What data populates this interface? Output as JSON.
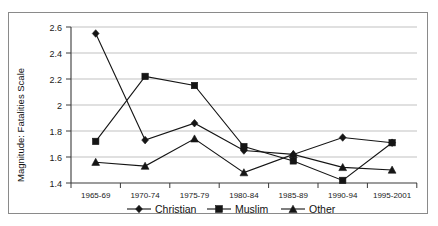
{
  "chart_data": {
    "type": "line",
    "title": "",
    "xlabel": "",
    "ylabel": "Magnitude: Fatalities Scale",
    "categories": [
      "1965-69",
      "1970-74",
      "1975-79",
      "1980-84",
      "1985-89",
      "1990-94",
      "1995-2001"
    ],
    "ylim": [
      1.4,
      2.6
    ],
    "ytick_labels": [
      "1.4",
      "1.6",
      "1.8",
      "2",
      "2.2",
      "2.4",
      "2.6"
    ],
    "ytick_values": [
      1.4,
      1.6,
      1.8,
      2.0,
      2.2,
      2.4,
      2.6
    ],
    "grid": true,
    "legend_position": "bottom",
    "series": [
      {
        "name": "Christian",
        "marker": "diamond",
        "values": [
          2.55,
          1.73,
          1.86,
          1.65,
          1.62,
          1.75,
          1.71
        ]
      },
      {
        "name": "Muslim",
        "marker": "square",
        "values": [
          1.72,
          2.22,
          2.15,
          1.68,
          1.57,
          1.42,
          1.71
        ]
      },
      {
        "name": "Other",
        "marker": "triangle",
        "values": [
          1.56,
          1.53,
          1.74,
          1.48,
          1.62,
          1.52,
          1.5
        ]
      }
    ]
  },
  "colors": {
    "series": "#151515",
    "gridline": "#a6a6a6",
    "axis": "#3a3a3a",
    "frame_border": "#8a8a8a",
    "background": "#ffffff"
  }
}
